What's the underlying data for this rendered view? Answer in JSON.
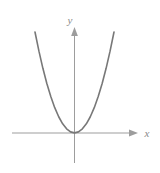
{
  "figure": {
    "kind": "coordinate-plane-graph",
    "width": 160,
    "height": 173,
    "background_color": "#ffffff"
  },
  "axes": {
    "x_axis_label": "x",
    "y_axis_label": "y",
    "axis_color": "#9d9d9d",
    "origin_px": {
      "x": 74,
      "y": 133
    },
    "x_axis_span_px": {
      "start": 12,
      "end": 138
    },
    "y_axis_span_px": {
      "start": 27,
      "end": 163
    },
    "arrowheads": [
      "x-positive",
      "y-positive"
    ],
    "tick_labels": [],
    "grid": false
  },
  "curve": {
    "color": "#787878",
    "stroke_width": 1.6,
    "description": "upward-opening parabola with vertex at the origin"
  },
  "chart_data": {
    "type": "line",
    "title": "",
    "xlabel": "x",
    "ylabel": "y",
    "grid": false,
    "legend": null,
    "xlim": [
      -4.1,
      4.1
    ],
    "ylim": [
      -1.0,
      10.5
    ],
    "series": [
      {
        "name": "y = x^2",
        "x": [
          -4.0,
          -3.6,
          -3.2,
          -2.8,
          -2.4,
          -2.0,
          -1.6,
          -1.2,
          -0.8,
          -0.4,
          0.0,
          0.4,
          0.8,
          1.2,
          1.6,
          2.0,
          2.4,
          2.8,
          3.2,
          3.6,
          4.0
        ],
        "y": [
          16.0,
          12.96,
          10.24,
          7.84,
          5.76,
          4.0,
          2.56,
          1.44,
          0.64,
          0.16,
          0.0,
          0.16,
          0.64,
          1.44,
          2.56,
          4.0,
          5.76,
          7.84,
          10.24,
          12.96,
          16.0
        ]
      }
    ]
  }
}
